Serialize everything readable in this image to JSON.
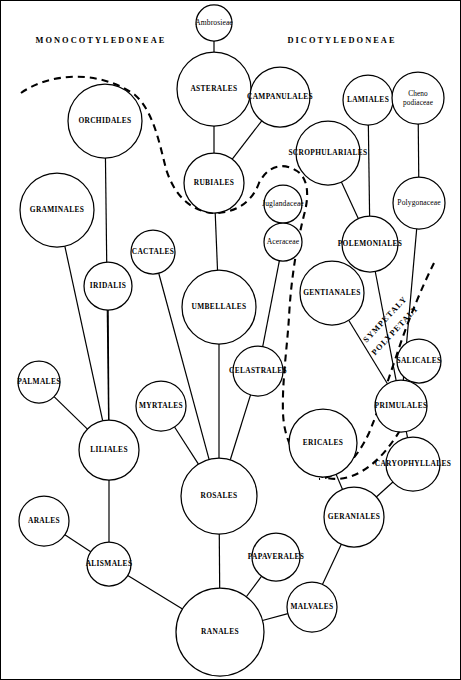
{
  "diagram": {
    "headings": [
      {
        "id": "monocot",
        "text": "MONOCOTYLEDONEAE",
        "x": 100,
        "y": 42
      },
      {
        "id": "dicot",
        "text": "DICOTYLEDONEAE",
        "x": 341,
        "y": 42
      }
    ],
    "boundary_labels": [
      {
        "id": "sympetaly",
        "text": "SYMPETALY",
        "x": 386,
        "y": 320,
        "rotate": -47
      },
      {
        "id": "polypetaly",
        "text": "POLYPETALY",
        "x": 396,
        "y": 331,
        "rotate": -47
      }
    ],
    "nodes": [
      {
        "id": "ambrosieae",
        "label": "Ambrosieae",
        "x": 213,
        "y": 22,
        "r": 18,
        "style": "family"
      },
      {
        "id": "asterales",
        "label": "ASTERALES",
        "x": 213,
        "y": 88,
        "r": 37,
        "style": "order"
      },
      {
        "id": "campanulales",
        "label": "CAMPANULALES",
        "x": 279,
        "y": 96,
        "r": 30,
        "style": "order"
      },
      {
        "id": "lamiales",
        "label": "LAMIALES",
        "x": 367,
        "y": 99,
        "r": 25,
        "style": "order"
      },
      {
        "id": "chenopodiaceae",
        "label": "Cheno podiaceae",
        "x": 417,
        "y": 97,
        "r": 26,
        "style": "family2"
      },
      {
        "id": "orchidales",
        "label": "ORCHIDALES",
        "x": 104,
        "y": 120,
        "r": 37,
        "style": "order"
      },
      {
        "id": "scrophulariales",
        "label": "SCROPHULARIALES",
        "x": 327,
        "y": 152,
        "r": 32,
        "style": "order"
      },
      {
        "id": "rubiales",
        "label": "RUBIALES",
        "x": 213,
        "y": 182,
        "r": 30,
        "style": "order"
      },
      {
        "id": "juglandaceae",
        "label": "Juglandaceae",
        "x": 282,
        "y": 203,
        "r": 19,
        "style": "family"
      },
      {
        "id": "graminales",
        "label": "GRAMINALES",
        "x": 56,
        "y": 209,
        "r": 37,
        "style": "order"
      },
      {
        "id": "polygonaceae",
        "label": "Polygonaceae",
        "x": 418,
        "y": 202,
        "r": 26,
        "style": "family"
      },
      {
        "id": "aceraceae",
        "label": "Aceraceae",
        "x": 282,
        "y": 241,
        "r": 19,
        "style": "family"
      },
      {
        "id": "polemoniales",
        "label": "POLEMONIALES",
        "x": 369,
        "y": 243,
        "r": 28,
        "style": "order"
      },
      {
        "id": "cactales",
        "label": "CACTALES",
        "x": 152,
        "y": 251,
        "r": 22,
        "style": "order"
      },
      {
        "id": "iridalis",
        "label": "IRIDALIS",
        "x": 107,
        "y": 285,
        "r": 24,
        "style": "order"
      },
      {
        "id": "gentianales",
        "label": "GENTIANALES",
        "x": 331,
        "y": 292,
        "r": 32,
        "style": "order"
      },
      {
        "id": "umbellales",
        "label": "UMBELLALES",
        "x": 218,
        "y": 306,
        "r": 37,
        "style": "order"
      },
      {
        "id": "salicales",
        "label": "SALICALES",
        "x": 418,
        "y": 360,
        "r": 22,
        "style": "order"
      },
      {
        "id": "celastrales",
        "label": "CELASTRALES",
        "x": 257,
        "y": 370,
        "r": 25,
        "style": "order"
      },
      {
        "id": "palmales",
        "label": "PALMALES",
        "x": 38,
        "y": 381,
        "r": 21,
        "style": "order"
      },
      {
        "id": "myrtales",
        "label": "MYRTALES",
        "x": 160,
        "y": 405,
        "r": 25,
        "style": "order"
      },
      {
        "id": "primulales",
        "label": "PRIMULALES",
        "x": 400,
        "y": 405,
        "r": 26,
        "style": "order"
      },
      {
        "id": "ericales",
        "label": "ERICALES",
        "x": 322,
        "y": 442,
        "r": 34,
        "style": "order"
      },
      {
        "id": "liliales",
        "label": "LILIALES",
        "x": 108,
        "y": 449,
        "r": 30,
        "style": "order"
      },
      {
        "id": "caryophyllales",
        "label": "CARYOPHYLLALES",
        "x": 412,
        "y": 463,
        "r": 27,
        "style": "order"
      },
      {
        "id": "rosales",
        "label": "ROSALES",
        "x": 218,
        "y": 495,
        "r": 38,
        "style": "order"
      },
      {
        "id": "geraniales",
        "label": "GERANIALES",
        "x": 353,
        "y": 516,
        "r": 30,
        "style": "order"
      },
      {
        "id": "arales",
        "label": "ARALES",
        "x": 43,
        "y": 520,
        "r": 25,
        "style": "order"
      },
      {
        "id": "papaverales",
        "label": "PAPAVERALES",
        "x": 275,
        "y": 556,
        "r": 24,
        "style": "order"
      },
      {
        "id": "alismales",
        "label": "ALISMALES",
        "x": 108,
        "y": 563,
        "r": 22,
        "style": "order"
      },
      {
        "id": "malvales",
        "label": "MALVALES",
        "x": 311,
        "y": 606,
        "r": 25,
        "style": "order"
      },
      {
        "id": "ranales",
        "label": "RANALES",
        "x": 219,
        "y": 631,
        "r": 44,
        "style": "order"
      }
    ],
    "edges": [
      {
        "from": "ambrosieae",
        "to": "asterales"
      },
      {
        "from": "asterales",
        "to": "rubiales"
      },
      {
        "from": "campanulales",
        "to": "rubiales"
      },
      {
        "from": "lamiales",
        "to": "polemoniales"
      },
      {
        "from": "chenopodiaceae",
        "to": "polygonaceae"
      },
      {
        "from": "scrophulariales",
        "to": "polemoniales"
      },
      {
        "from": "juglandaceae",
        "to": "aceraceae"
      },
      {
        "from": "polygonaceae",
        "to": "primulales"
      },
      {
        "from": "polemoniales",
        "to": "primulales"
      },
      {
        "from": "gentianales",
        "to": "primulales"
      },
      {
        "from": "aceraceae",
        "to": "celastrales"
      },
      {
        "from": "orchidales",
        "to": "liliales"
      },
      {
        "from": "graminales",
        "to": "liliales"
      },
      {
        "from": "iridalis",
        "to": "liliales"
      },
      {
        "from": "cactales",
        "to": "rosales"
      },
      {
        "from": "rubiales",
        "to": "umbellales"
      },
      {
        "from": "umbellales",
        "to": "rosales"
      },
      {
        "from": "celastrales",
        "to": "rosales"
      },
      {
        "from": "myrtales",
        "to": "rosales"
      },
      {
        "from": "palmales",
        "to": "liliales"
      },
      {
        "from": "salicales",
        "to": "primulales"
      },
      {
        "from": "primulales",
        "to": "caryophyllales"
      },
      {
        "from": "ericales",
        "to": "geraniales"
      },
      {
        "from": "caryophyllales",
        "to": "geraniales"
      },
      {
        "from": "liliales",
        "to": "alismales"
      },
      {
        "from": "arales",
        "to": "alismales"
      },
      {
        "from": "alismales",
        "to": "ranales"
      },
      {
        "from": "rosales",
        "to": "ranales"
      },
      {
        "from": "papaverales",
        "to": "ranales"
      },
      {
        "from": "malvales",
        "to": "ranales"
      },
      {
        "from": "geraniales",
        "to": "malvales"
      }
    ],
    "boundary_curves": [
      {
        "id": "monocot-dicot-divider",
        "path": "M 20 92 C 48 72 98 68 134 94 C 152 110 158 140 165 168 C 172 190 186 210 213 212 C 240 212 253 196 258 182 C 266 166 281 160 296 170 C 308 178 308 196 303 214 C 297 238 290 276 288 316 C 286 348 281 380 282 412 C 283 440 296 466 322 476 C 348 484 374 466 392 440 C 404 424 406 412 400 400"
      },
      {
        "id": "sympetaly-polypetaly-divider",
        "path": "M 433 262 C 420 288 406 322 395 356 C 386 382 378 408 368 432 C 356 458 338 476 318 478"
      }
    ]
  }
}
